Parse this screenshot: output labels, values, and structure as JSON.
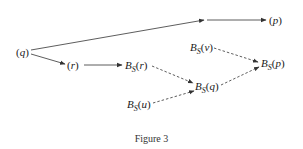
{
  "figure": {
    "caption": "Figure 3",
    "colors": {
      "stroke": "#333333",
      "text": "#1a1a1a",
      "background": "#ffffff"
    },
    "nodes": {
      "q": {
        "base": "q",
        "sub": "",
        "open": "(",
        "close": ")"
      },
      "r": {
        "base": "r",
        "sub": "",
        "open": "(",
        "close": ")"
      },
      "p": {
        "base": "p",
        "sub": "",
        "open": "(",
        "close": ")"
      },
      "Bsr": {
        "prefix": "B",
        "sub": "S",
        "open": "(",
        "arg": "r",
        "close": ")"
      },
      "Bsv": {
        "prefix": "B",
        "sub": "S",
        "open": "(",
        "arg": "v",
        "close": ")"
      },
      "Bsp": {
        "prefix": "B",
        "sub": "S",
        "open": "(",
        "arg": "p",
        "close": ")"
      },
      "Bsq": {
        "prefix": "B",
        "sub": "S",
        "open": "(",
        "arg": "q",
        "close": ")"
      },
      "Bsu": {
        "prefix": "B",
        "sub": "S",
        "open": "(",
        "arg": "u",
        "close": ")"
      }
    },
    "edges": [
      {
        "from": "(q)",
        "to": "(p)",
        "style": "solid",
        "note": "two-segment arrow via midpoint"
      },
      {
        "from": "(q)",
        "to": "(r)",
        "style": "solid"
      },
      {
        "from": "(r)",
        "to": "B_S(r)",
        "style": "solid"
      },
      {
        "from": "B_S(r)",
        "to": "B_S(q)",
        "style": "dashed"
      },
      {
        "from": "B_S(u)",
        "to": "B_S(q)",
        "style": "dashed"
      },
      {
        "from": "B_S(q)",
        "to": "B_S(p)",
        "style": "dashed"
      },
      {
        "from": "B_S(v)",
        "to": "B_S(p)",
        "style": "dashed"
      }
    ]
  }
}
